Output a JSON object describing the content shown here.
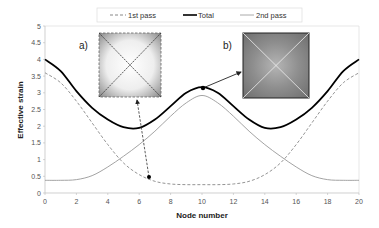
{
  "chart_data": {
    "type": "line",
    "title": "",
    "xlabel": "Node number",
    "ylabel": "Effective strain",
    "xlim": [
      0,
      20
    ],
    "ylim": [
      0,
      5
    ],
    "x_ticks": [
      "0",
      "2",
      "4",
      "6",
      "8",
      "10",
      "12",
      "14",
      "16",
      "18",
      "20"
    ],
    "y_ticks": [
      "0",
      "0.5",
      "1",
      "1.5",
      "2",
      "2.5",
      "3",
      "3.5",
      "4",
      "4.5",
      "5"
    ],
    "grid": false,
    "legend_position": "top",
    "x": [
      0,
      1,
      2,
      3,
      4,
      5,
      6,
      7,
      8,
      9,
      10,
      11,
      12,
      13,
      14,
      15,
      16,
      17,
      18,
      19,
      20
    ],
    "series": [
      {
        "name": "1st pass",
        "style": "dashed",
        "color": "#888888",
        "values": [
          3.6,
          3.3,
          2.75,
          2.1,
          1.45,
          0.9,
          0.55,
          0.35,
          0.27,
          0.25,
          0.25,
          0.25,
          0.27,
          0.35,
          0.55,
          0.9,
          1.45,
          2.1,
          2.75,
          3.3,
          3.6
        ]
      },
      {
        "name": "Total",
        "style": "solid-bold",
        "color": "#000000",
        "values": [
          4.0,
          3.65,
          3.05,
          2.55,
          2.2,
          1.97,
          1.95,
          2.2,
          2.6,
          3.0,
          3.17,
          3.0,
          2.6,
          2.2,
          1.95,
          1.97,
          2.2,
          2.55,
          3.05,
          3.65,
          4.0
        ]
      },
      {
        "name": "2nd pass",
        "style": "solid-thin",
        "color": "#999999",
        "values": [
          0.38,
          0.38,
          0.4,
          0.52,
          0.78,
          1.1,
          1.45,
          1.85,
          2.3,
          2.7,
          2.92,
          2.7,
          2.3,
          1.85,
          1.45,
          1.1,
          0.78,
          0.52,
          0.4,
          0.38,
          0.38
        ]
      }
    ],
    "annotations": [
      {
        "label": "a)",
        "points_to": {
          "x": 6.6,
          "y": 0.45
        },
        "inset": "strain map after 1st pass"
      },
      {
        "label": "b)",
        "points_to": {
          "x": 10,
          "y": 3.17
        },
        "inset": "strain map total"
      }
    ]
  },
  "legend": {
    "items": [
      "1st pass",
      "Total",
      "2nd pass"
    ]
  },
  "axes": {
    "xlabel": "Node number",
    "ylabel": "Effective strain"
  },
  "insets": {
    "a_label": "a)",
    "b_label": "b)"
  }
}
